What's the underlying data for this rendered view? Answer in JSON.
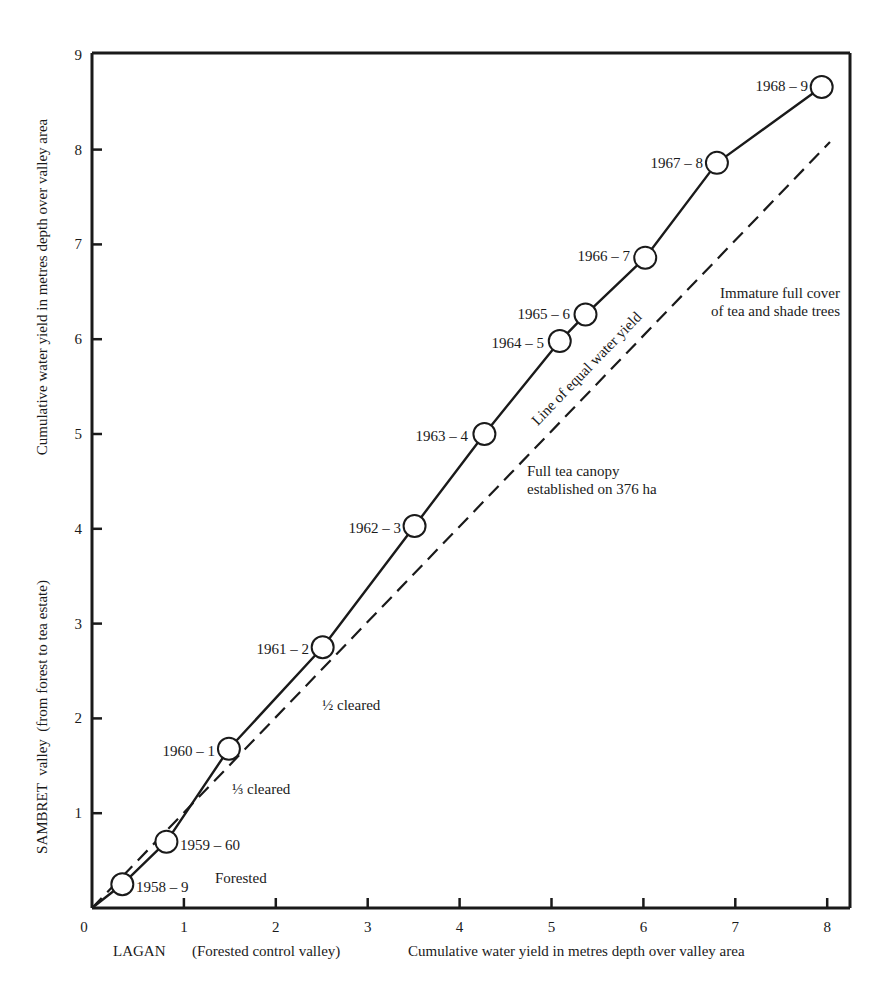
{
  "chart_data": {
    "type": "line",
    "title": "",
    "xlabel": "LAGAN (Forested control valley)   Cumulative water yield in metres depth over valley area",
    "xlabel_parts": {
      "left": "LAGAN",
      "middle": "(Forested control valley)",
      "right": "Cumulative water yield in metres depth over valley area"
    },
    "ylabel": "SAMBRET valley (from forest to tea estate)   Cumulative water yield in metres depth over valley area",
    "ylabel_parts": {
      "lower": "SAMBRET  valley  (from forest to tea estate)",
      "upper": "Cumulative water yield in metres depth over valley area"
    },
    "xlim": [
      0,
      8.25
    ],
    "ylim": [
      0,
      9
    ],
    "grid": false,
    "legend": null,
    "x_ticks": [
      "0",
      "1",
      "2",
      "3",
      "4",
      "5",
      "6",
      "7",
      "8"
    ],
    "y_ticks": [
      "1",
      "2",
      "3",
      "4",
      "5",
      "6",
      "7",
      "8",
      "9"
    ],
    "series": [
      {
        "name": "Sambret vs Lagan cumulative yield",
        "style": "solid line with open circle markers",
        "points": [
          {
            "label": "1958-9",
            "x": 0.33,
            "y": 0.25
          },
          {
            "label": "1959-60",
            "x": 0.81,
            "y": 0.7
          },
          {
            "label": "1960-1",
            "x": 1.49,
            "y": 1.68
          },
          {
            "label": "1961-2",
            "x": 2.51,
            "y": 2.75
          },
          {
            "label": "1962-3",
            "x": 3.51,
            "y": 4.03
          },
          {
            "label": "1963-4",
            "x": 4.27,
            "y": 5.0
          },
          {
            "label": "1964-5",
            "x": 5.09,
            "y": 5.98
          },
          {
            "label": "1965-6",
            "x": 5.37,
            "y": 6.26
          },
          {
            "label": "1966-7",
            "x": 6.02,
            "y": 6.86
          },
          {
            "label": "1967-8",
            "x": 6.8,
            "y": 7.86
          },
          {
            "label": "1968-9",
            "x": 7.94,
            "y": 8.66
          }
        ]
      },
      {
        "name": "Line of equal water yield",
        "style": "dashed",
        "points": [
          {
            "x": 0,
            "y": 0
          },
          {
            "x": 8.03,
            "y": 8.08
          }
        ]
      }
    ],
    "annotations": [
      {
        "text": "Forested",
        "x": 1.3,
        "y": 0.3
      },
      {
        "text": "⅓ cleared",
        "x": 1.7,
        "y": 1.0
      },
      {
        "text": "½ cleared",
        "x": 2.6,
        "y": 2.1
      },
      {
        "text": "Line of equal water yield",
        "x": 4.8,
        "y": 5.7,
        "rotation": -46
      },
      {
        "text": "Full tea canopy",
        "x": 5.0,
        "y": 4.75
      },
      {
        "text": "established on 376 ha",
        "x": 5.0,
        "y": 4.45
      },
      {
        "text": "Immature full cover",
        "x": 6.6,
        "y": 6.05
      },
      {
        "text": "of tea and shade trees",
        "x": 6.6,
        "y": 5.75
      }
    ]
  },
  "labels": {
    "origin": "0",
    "point_labels": [
      "1958 – 9",
      "1959 – 60",
      "1960 – 1",
      "1961 – 2",
      "1962 – 3",
      "1963 – 4",
      "1964 – 5",
      "1965 – 6",
      "1966 – 7",
      "1967 – 8",
      "1968 – 9"
    ],
    "forested": "Forested",
    "third_cleared": "⅓ cleared",
    "half_cleared": "½ cleared",
    "equal_line": "Line of equal water yield",
    "full_canopy_1": "Full tea canopy",
    "full_canopy_2": "established on 376 ha",
    "immature_1": "Immature full cover",
    "immature_2": "of tea and shade trees"
  },
  "colors": {
    "ink": "#1a1a1a",
    "background": "#ffffff"
  }
}
